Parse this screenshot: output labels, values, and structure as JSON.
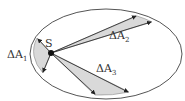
{
  "diagram": {
    "colors": {
      "ellipse_stroke": "#555555",
      "wedge_fill": "#d9d9d9",
      "arrow": "#222222",
      "focus": "#111111"
    },
    "ellipse": {
      "cx": 106,
      "cy": 54,
      "rx": 76,
      "ry": 45
    },
    "focus": {
      "label": "S",
      "x": 51,
      "y": 53
    },
    "wedges": [
      {
        "label_main": "ΔA",
        "label_sub": "1",
        "p1": [
          37,
          38
        ],
        "p2": [
          43,
          73
        ]
      },
      {
        "label_main": "ΔA",
        "label_sub": "2",
        "p1": [
          137,
          16
        ],
        "p2": [
          152,
          22
        ]
      },
      {
        "label_main": "ΔA",
        "label_sub": "3",
        "p1": [
          95,
          95
        ],
        "p2": [
          129,
          92
        ]
      }
    ]
  }
}
